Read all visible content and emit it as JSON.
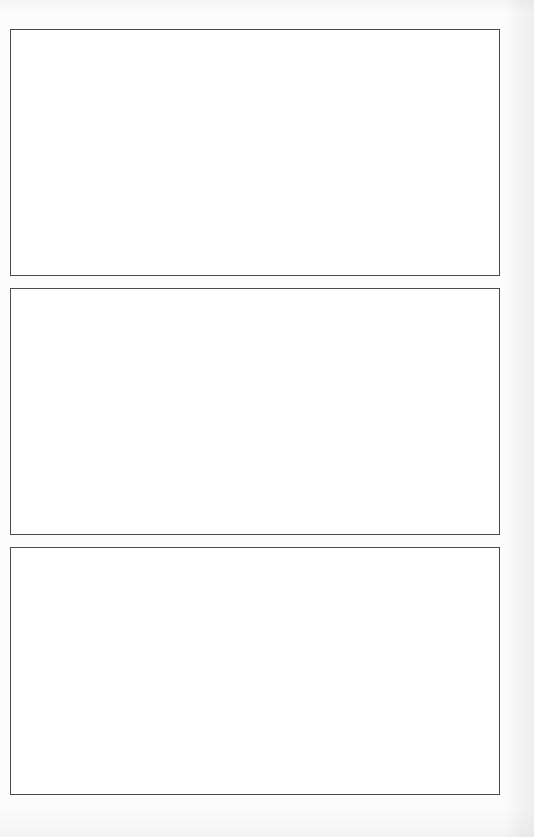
{
  "document": {
    "type": "scanned-page",
    "description": "Blank page with three empty rectangular frames",
    "frames": [
      {
        "id": "frame-1",
        "content": ""
      },
      {
        "id": "frame-2",
        "content": ""
      },
      {
        "id": "frame-3",
        "content": ""
      }
    ]
  },
  "colors": {
    "background": "#fcfcfc",
    "frame_border": "#4a4a4a",
    "frame_fill": "#ffffff"
  }
}
